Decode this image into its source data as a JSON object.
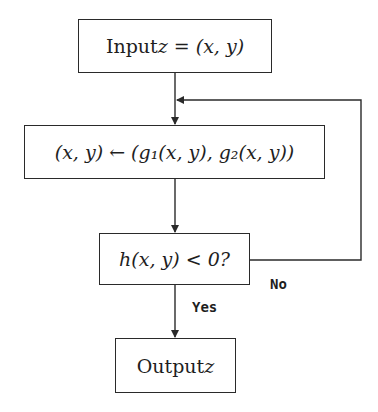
{
  "diagram": {
    "type": "flowchart",
    "nodes": [
      {
        "id": "input",
        "text": "Input z = (x, y)",
        "prefix": "Input ",
        "math": "z = (x, y)"
      },
      {
        "id": "update",
        "text": "(x, y) ← (g₁(x, y), g₂(x, y))",
        "math": "(x, y) ← (g₁(x, y), g₂(x, y))"
      },
      {
        "id": "decision",
        "text": "h(x, y) < 0?",
        "math": "h(x, y) < 0?"
      },
      {
        "id": "output",
        "text": "Output z",
        "prefix": "Output ",
        "math": "z"
      }
    ],
    "edges": [
      {
        "from": "input",
        "to": "update",
        "label": ""
      },
      {
        "from": "update",
        "to": "decision",
        "label": ""
      },
      {
        "from": "decision",
        "to": "output",
        "label": "Yes"
      },
      {
        "from": "decision",
        "to": "update",
        "label": "No"
      }
    ],
    "labels": {
      "yes": "Yes",
      "no": "No"
    },
    "colors": {
      "line": "#2a2a2a",
      "text": "#1e1e1e",
      "background": "#ffffff"
    }
  }
}
